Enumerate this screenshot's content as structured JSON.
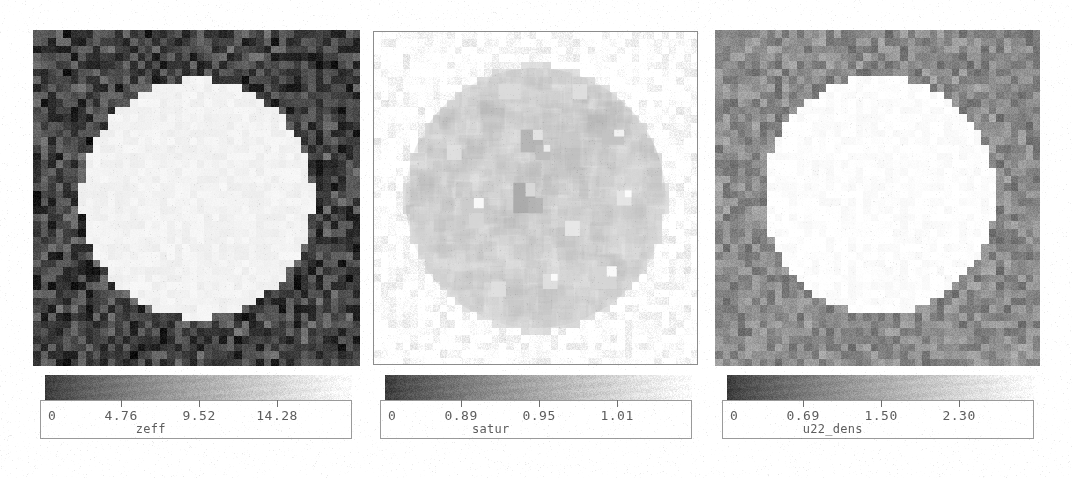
{
  "figure": {
    "background": "#ffffff",
    "ink_color": "#5d5d5d",
    "frame_color": "#9a9a9a",
    "panel_count": 3
  },
  "chart_data": [
    {
      "type": "heatmap",
      "name": "zeff",
      "title": "",
      "xlabel": "",
      "ylabel": "",
      "colorbar": {
        "label": "zeff",
        "ticks": [
          0,
          4.76,
          9.52,
          14.28
        ],
        "tick_labels": [
          "0",
          "4.76",
          "9.52",
          "14.28"
        ],
        "tick_positions": [
          0.02,
          0.26,
          0.51,
          0.76
        ],
        "range": [
          0,
          19.04
        ],
        "orientation": "horizontal",
        "gradient": "grayscale-dark-to-light"
      },
      "field": {
        "description": "square map, dark noisy background with bright pixelated disk at center",
        "background_value": 2.2,
        "disk_value": 17.5,
        "background_gray": "#444444",
        "disk_gray": "#f2f2f2",
        "disk_center_x": 0.5,
        "disk_center_y": 0.5,
        "disk_radius": 0.355,
        "noise_amplitude": 0.22,
        "quantize_cells": 44
      }
    },
    {
      "type": "heatmap",
      "name": "satur",
      "title": "",
      "xlabel": "",
      "ylabel": "",
      "colorbar": {
        "label": "satur",
        "ticks": [
          0,
          0.89,
          0.95,
          1.01
        ],
        "tick_labels": [
          "0",
          "0.89",
          "0.95",
          "1.01"
        ],
        "tick_positions": [
          0.02,
          0.26,
          0.51,
          0.76
        ],
        "range": [
          0,
          1.07
        ],
        "orientation": "horizontal",
        "gradient": "grayscale-dark-to-light"
      },
      "field": {
        "description": "square map, white background with faint mottled disk and scattered dark square blobs",
        "background_value": 1.01,
        "disk_value": 0.96,
        "background_gray": "#ffffff",
        "disk_gray": "#dcdcdc",
        "disk_center_x": 0.5,
        "disk_center_y": 0.5,
        "disk_radius": 0.4,
        "noise_amplitude": 0.1,
        "quantize_cells": 44,
        "blobs": [
          {
            "x": 0.455,
            "y": 0.3,
            "w": 0.075,
            "h": 0.065,
            "value": 0.7
          },
          {
            "x": 0.505,
            "y": 0.345,
            "w": 0.045,
            "h": 0.04,
            "value": 0.74
          },
          {
            "x": 0.695,
            "y": 0.305,
            "w": 0.07,
            "h": 0.055,
            "value": 0.76
          },
          {
            "x": 0.43,
            "y": 0.465,
            "w": 0.07,
            "h": 0.08,
            "value": 0.66
          },
          {
            "x": 0.47,
            "y": 0.505,
            "w": 0.04,
            "h": 0.05,
            "value": 0.7
          },
          {
            "x": 0.265,
            "y": 0.49,
            "w": 0.06,
            "h": 0.06,
            "value": 0.8
          },
          {
            "x": 0.29,
            "y": 0.54,
            "w": 0.055,
            "h": 0.045,
            "value": 0.84
          },
          {
            "x": 0.39,
            "y": 0.15,
            "w": 0.06,
            "h": 0.055,
            "value": 0.86
          },
          {
            "x": 0.615,
            "y": 0.165,
            "w": 0.05,
            "h": 0.05,
            "value": 0.88
          },
          {
            "x": 0.69,
            "y": 0.7,
            "w": 0.06,
            "h": 0.06,
            "value": 0.84
          },
          {
            "x": 0.52,
            "y": 0.72,
            "w": 0.055,
            "h": 0.045,
            "value": 0.88
          },
          {
            "x": 0.36,
            "y": 0.745,
            "w": 0.05,
            "h": 0.045,
            "value": 0.88
          },
          {
            "x": 0.225,
            "y": 0.33,
            "w": 0.05,
            "h": 0.05,
            "value": 0.88
          },
          {
            "x": 0.76,
            "y": 0.47,
            "w": 0.055,
            "h": 0.05,
            "value": 0.9
          },
          {
            "x": 0.6,
            "y": 0.56,
            "w": 0.045,
            "h": 0.04,
            "value": 0.91
          }
        ]
      }
    },
    {
      "type": "heatmap",
      "name": "u22_dens",
      "title": "",
      "xlabel": "",
      "ylabel": "",
      "colorbar": {
        "label": "u22_dens",
        "ticks": [
          0,
          0.69,
          1.5,
          2.3
        ],
        "tick_labels": [
          "0",
          "0.69",
          "1.50",
          "2.30"
        ],
        "tick_positions": [
          0.02,
          0.26,
          0.51,
          0.76
        ],
        "range": [
          0,
          3.05
        ],
        "orientation": "horizontal",
        "gradient": "grayscale-dark-to-light"
      },
      "field": {
        "description": "square map, mid-gray noisy background with bright white pixelated disk",
        "background_value": 0.62,
        "disk_value": 2.85,
        "background_gray": "#8b8b8b",
        "disk_gray": "#fdfdfd",
        "disk_center_x": 0.505,
        "disk_center_y": 0.49,
        "disk_radius": 0.355,
        "noise_amplitude": 0.14,
        "quantize_cells": 44
      }
    }
  ],
  "layout": {
    "panels": [
      {
        "key": "zeff",
        "plot": {
          "x": 33,
          "y": 30,
          "w": 327,
          "h": 336
        },
        "colorbar": {
          "x": 40,
          "y": 375,
          "w": 312,
          "h": 64
        },
        "strip": {
          "x": 5,
          "y": 0,
          "w": 307,
          "h": 26
        },
        "box": {
          "x": 0,
          "y": 25,
          "w": 312,
          "h": 39
        },
        "tick_y": 25,
        "tick_h": 7,
        "label_y": 34,
        "name_y": 48,
        "name_x": 0.355
      },
      {
        "key": "satur",
        "plot": {
          "x": 373,
          "y": 31,
          "w": 325,
          "h": 334
        },
        "colorbar": {
          "x": 380,
          "y": 375,
          "w": 312,
          "h": 64
        },
        "strip": {
          "x": 5,
          "y": 0,
          "w": 307,
          "h": 26
        },
        "box": {
          "x": 0,
          "y": 25,
          "w": 312,
          "h": 39
        },
        "tick_y": 25,
        "tick_h": 7,
        "label_y": 34,
        "name_y": 48,
        "name_x": 0.355
      },
      {
        "key": "u22_dens",
        "plot": {
          "x": 715,
          "y": 30,
          "w": 325,
          "h": 336
        },
        "colorbar": {
          "x": 722,
          "y": 375,
          "w": 312,
          "h": 64
        },
        "strip": {
          "x": 5,
          "y": 0,
          "w": 307,
          "h": 26
        },
        "box": {
          "x": 0,
          "y": 25,
          "w": 312,
          "h": 39
        },
        "tick_y": 25,
        "tick_h": 7,
        "label_y": 34,
        "name_y": 48,
        "name_x": 0.355
      }
    ]
  }
}
